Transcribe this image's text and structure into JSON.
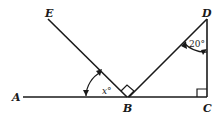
{
  "diagram": {
    "points": {
      "A": {
        "label": "A",
        "x": 14,
        "y": 99
      },
      "B": {
        "label": "B",
        "x": 127,
        "y": 97
      },
      "C": {
        "label": "C",
        "x": 207,
        "y": 97
      },
      "D": {
        "label": "D",
        "x": 207,
        "y": 19
      },
      "E": {
        "label": "E",
        "x": 48,
        "y": 19
      }
    },
    "angles": {
      "x_label": "x°",
      "d_label": "20°"
    },
    "colors": {
      "stroke": "#1a1a1a",
      "background": "#ffffff"
    }
  }
}
